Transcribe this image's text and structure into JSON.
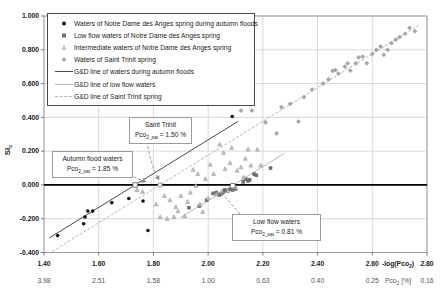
{
  "chart_data": {
    "type": "scatter",
    "title": "",
    "xlabel": "-log(Pco2)",
    "xlabel_parts": {
      "pre": "-log(Pco",
      "sub": "2",
      "post": ")"
    },
    "xlabel_secondary": "Pco2 [%]",
    "xlabel_secondary_parts": {
      "pre": "Pco",
      "sub": "2",
      "post": " [%]"
    },
    "ylabel": "SIc",
    "ylabel_parts": {
      "pre": "SI",
      "sub": "c"
    },
    "xlim": [
      1.4,
      2.8
    ],
    "ylim": [
      -0.4,
      1.0
    ],
    "grid": true,
    "legend_position": "top-left",
    "x_tick_values": [
      1.4,
      1.6,
      1.8,
      2.0,
      2.2,
      2.4,
      2.6,
      2.8
    ],
    "x_ticks": [
      "1.40",
      "1.60",
      "1.80",
      "2.00",
      "2.20",
      "2.40",
      "2.60",
      "2.80"
    ],
    "x_ticks_secondary": [
      "3.98",
      "2.51",
      "1.58",
      "1.00",
      "0.63",
      "0.40",
      "0.25",
      "0.16"
    ],
    "y_tick_values": [
      1.0,
      0.8,
      0.6,
      0.4,
      0.2,
      0.0,
      -0.2,
      -0.4
    ],
    "y_ticks": [
      "1.000",
      "0.800",
      "0.600",
      "0.400",
      "0.200",
      "0.000",
      "-0.200",
      "-0.400"
    ],
    "colors": {
      "grid": "#c9c9c9",
      "zero_line": "#000000",
      "dark_line": "#4a4a4a",
      "light_line": "#b8b8b8"
    },
    "series": [
      {
        "name": "Waters of Notre Dame des Anges spring during autumn floods",
        "marker": "circle",
        "color": "#111111",
        "points": [
          [
            1.45,
            -0.3
          ],
          [
            1.545,
            -0.23
          ],
          [
            1.55,
            -0.19
          ],
          [
            1.56,
            -0.155
          ],
          [
            1.578,
            -0.155
          ],
          [
            1.648,
            -0.105
          ],
          [
            1.71,
            -0.08
          ],
          [
            1.762,
            -0.095
          ],
          [
            1.78,
            -0.27
          ],
          [
            2.088,
            0.405
          ]
        ]
      },
      {
        "name": "Low flow waters of Notre Dame des Anges spring",
        "marker": "square",
        "color": "#6f6f6f",
        "points": [
          [
            1.93,
            -0.135
          ],
          [
            1.968,
            -0.125
          ],
          [
            1.995,
            -0.09
          ],
          [
            2.018,
            -0.05
          ],
          [
            2.03,
            -0.045
          ],
          [
            2.04,
            -0.06
          ],
          [
            2.048,
            -0.052
          ],
          [
            2.055,
            -0.04
          ],
          [
            2.06,
            -0.03
          ],
          [
            2.07,
            -0.035
          ],
          [
            2.08,
            -0.026
          ],
          [
            2.09,
            -0.03
          ],
          [
            2.1,
            -0.024
          ],
          [
            2.128,
            0.018
          ],
          [
            2.138,
            0.034
          ],
          [
            2.146,
            0.024
          ],
          [
            2.152,
            0.03
          ],
          [
            2.168,
            0.064
          ],
          [
            2.176,
            0.058
          ],
          [
            2.228,
            0.1
          ]
        ]
      },
      {
        "name": "Intermediate waters of Notre Dame des Anges spring",
        "marker": "triangle",
        "color": "#c0c0c0",
        "edge": "#909090",
        "points": [
          [
            1.74,
            -0.03
          ],
          [
            1.76,
            -0.04
          ],
          [
            1.81,
            -0.115
          ],
          [
            1.825,
            -0.19
          ],
          [
            1.84,
            -0.065
          ],
          [
            1.85,
            -0.2
          ],
          [
            1.86,
            -0.09
          ],
          [
            1.875,
            -0.19
          ],
          [
            1.882,
            -0.13
          ],
          [
            1.89,
            -0.155
          ],
          [
            1.9,
            -0.065
          ],
          [
            1.915,
            -0.185
          ],
          [
            1.925,
            -0.1
          ],
          [
            1.935,
            -0.045
          ],
          [
            1.945,
            0.09
          ],
          [
            1.955,
            -0.005
          ],
          [
            1.962,
            0.065
          ],
          [
            1.97,
            -0.115
          ],
          [
            1.98,
            -0.16
          ],
          [
            1.99,
            0.035
          ],
          [
            2.0,
            -0.08
          ],
          [
            2.008,
            0.12
          ],
          [
            2.02,
            0.065
          ],
          [
            2.03,
            -0.055
          ],
          [
            2.042,
            0.24
          ],
          [
            2.05,
            -0.04
          ],
          [
            2.056,
            0.19
          ],
          [
            2.062,
            0.095
          ],
          [
            2.072,
            -0.035
          ],
          [
            2.08,
            0.13
          ],
          [
            2.086,
            0.22
          ],
          [
            2.1,
            -0.015
          ],
          [
            2.106,
            0.085
          ],
          [
            2.12,
            0.105
          ],
          [
            2.13,
            0.045
          ],
          [
            2.136,
            0.155
          ],
          [
            2.146,
            0.21
          ],
          [
            2.156,
            0.115
          ],
          [
            2.18,
            0.21
          ],
          [
            2.192,
            0.115
          ]
        ]
      },
      {
        "name": "Waters of Saint Trinit spring",
        "marker": "diamond",
        "color": "#a6a6a6",
        "edge": "#8a8a8a",
        "points": [
          [
            2.12,
            0.44
          ],
          [
            2.16,
            0.44
          ],
          [
            2.21,
            0.37
          ],
          [
            2.25,
            0.305
          ],
          [
            2.268,
            0.46
          ],
          [
            2.3,
            0.48
          ],
          [
            2.33,
            0.375
          ],
          [
            2.35,
            0.52
          ],
          [
            2.38,
            0.565
          ],
          [
            2.42,
            0.6
          ],
          [
            2.44,
            0.625
          ],
          [
            2.455,
            0.675
          ],
          [
            2.465,
            0.68
          ],
          [
            2.476,
            0.66
          ],
          [
            2.5,
            0.7
          ],
          [
            2.51,
            0.72
          ],
          [
            2.52,
            0.676
          ],
          [
            2.54,
            0.72
          ],
          [
            2.55,
            0.755
          ],
          [
            2.565,
            0.76
          ],
          [
            2.58,
            0.72
          ],
          [
            2.6,
            0.775
          ],
          [
            2.615,
            0.8
          ],
          [
            2.63,
            0.82
          ],
          [
            2.642,
            0.77
          ],
          [
            2.656,
            0.8
          ],
          [
            2.67,
            0.84
          ],
          [
            2.686,
            0.86
          ],
          [
            2.7,
            0.875
          ],
          [
            2.72,
            0.895
          ],
          [
            2.736,
            0.93
          ],
          [
            2.756,
            0.91
          ]
        ]
      }
    ],
    "lines": [
      {
        "name": "G&D line of waters during autumn floods",
        "color": "#4a4a4a",
        "style": "solid",
        "x1": 1.42,
        "y1": -0.313,
        "x2": 2.11,
        "y2": 0.377
      },
      {
        "name": "G&D line of low flow waters",
        "color": "#b8b8b8",
        "style": "solid",
        "x1": 1.9,
        "y1": -0.192,
        "x2": 2.28,
        "y2": 0.188
      },
      {
        "name": "G&D line of Saint Trinit spring",
        "color": "#b8b8b8",
        "style": "dashed",
        "x1": 1.43,
        "y1": -0.394,
        "x2": 2.77,
        "y2": 0.946
      }
    ],
    "open_markers": [
      {
        "shape": "square",
        "x": 1.733,
        "y": 0.0
      },
      {
        "shape": "circle",
        "x": 1.824,
        "y": 0.0
      },
      {
        "shape": "square",
        "x": 2.09,
        "y": -0.005
      }
    ],
    "annotations": [
      {
        "id": "saint-trinit",
        "title": "Saint Trinit",
        "pco_pre": "Pco",
        "pco_sub": "2_sat",
        "pco_eq": " = 1.50 %",
        "target_x": 1.824,
        "target_y": 0.0
      },
      {
        "id": "autumn-flood",
        "title": "Autumn flood waters",
        "pco_pre": "Pco",
        "pco_sub": "2_sat",
        "pco_eq": " = 1.85 %",
        "target_x": 1.733,
        "target_y": 0.0
      },
      {
        "id": "low-flow",
        "title": "Low flow waters",
        "pco_pre": "Pco",
        "pco_sub": "2_sat",
        "pco_eq": " = 0.81 %",
        "target_x": 2.09,
        "target_y": 0.0
      }
    ]
  }
}
